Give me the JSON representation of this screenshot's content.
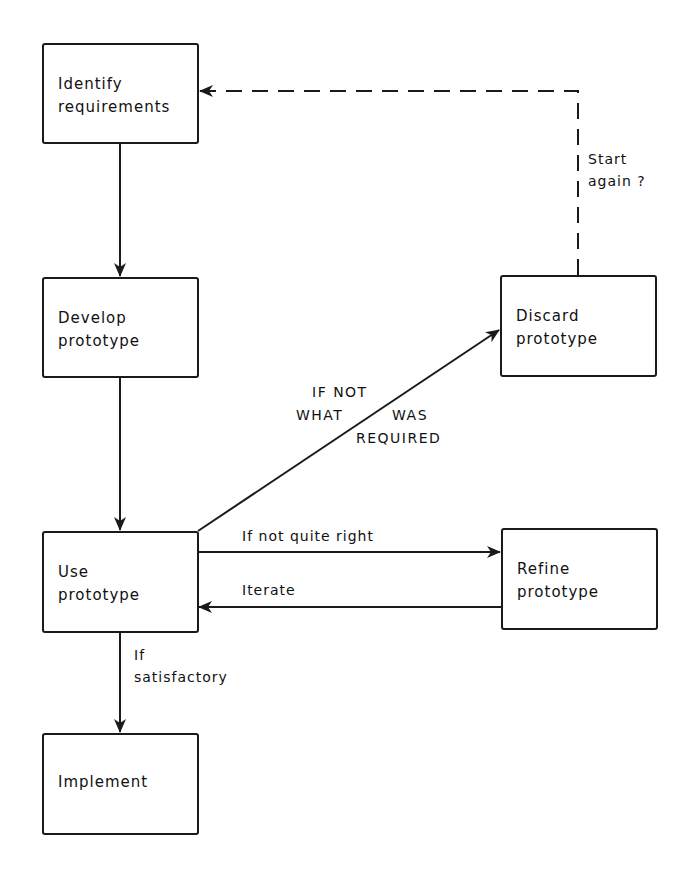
{
  "diagram": {
    "type": "flowchart",
    "nodes": [
      {
        "id": "identify",
        "label": "Identify\nrequirements"
      },
      {
        "id": "develop",
        "label": "Develop\nprototype"
      },
      {
        "id": "use",
        "label": "Use\nprototype"
      },
      {
        "id": "implement",
        "label": "Implement"
      },
      {
        "id": "discard",
        "label": "Discard\nprototype"
      },
      {
        "id": "refine",
        "label": "Refine\nprototype"
      }
    ],
    "edges": [
      {
        "from": "identify",
        "to": "develop",
        "label": "",
        "style": "solid"
      },
      {
        "from": "develop",
        "to": "use",
        "label": "",
        "style": "solid"
      },
      {
        "from": "use",
        "to": "discard",
        "label": "IF NOT\nWHAT WAS\nREQUIRED",
        "style": "solid"
      },
      {
        "from": "use",
        "to": "refine",
        "label": "If not quite right",
        "style": "solid"
      },
      {
        "from": "refine",
        "to": "use",
        "label": "Iterate",
        "style": "solid"
      },
      {
        "from": "use",
        "to": "implement",
        "label": "If\nsatisfactory",
        "style": "solid"
      },
      {
        "from": "discard",
        "to": "identify",
        "label": "Start\nagain ?",
        "style": "dashed"
      }
    ]
  },
  "labels": {
    "if_not_line1": "IF NOT",
    "if_not_what": "WHAT",
    "if_not_was": "WAS",
    "if_not_required": "REQUIRED",
    "not_quite_right": "If not quite right",
    "iterate": "Iterate",
    "if_satisfactory": "If\nsatisfactory",
    "start_again": "Start\nagain ?"
  }
}
